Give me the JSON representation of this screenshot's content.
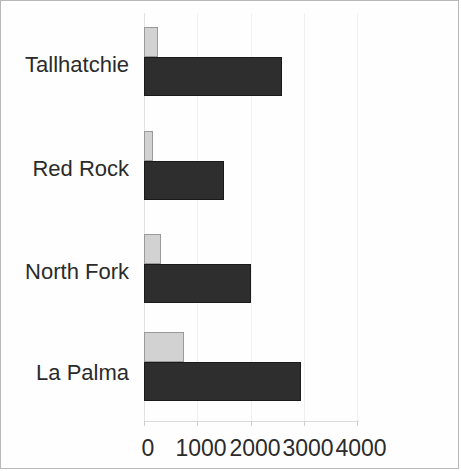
{
  "chart_data": {
    "type": "bar",
    "orientation": "horizontal",
    "title": "",
    "xlabel": "",
    "ylabel": "",
    "categories": [
      "Tallhatchie",
      "Red Rock",
      "North Fork",
      "La Palma"
    ],
    "series": [
      {
        "name": "light-series",
        "color": "#d2d2d2",
        "values": [
          270,
          170,
          320,
          750
        ]
      },
      {
        "name": "dark-series",
        "color": "#2e2e2e",
        "values": [
          2600,
          1500,
          2000,
          2950
        ]
      }
    ],
    "xticks": [
      0,
      1000,
      2000,
      3000,
      4000
    ],
    "xtick_labels": [
      "0",
      "1000",
      "2000",
      "3000",
      "4000"
    ],
    "xlim": [
      0,
      4000
    ],
    "grid": true,
    "grid_axis": "x",
    "legend": null,
    "legend_position": "none"
  },
  "axis": {
    "x_labels": [
      "0",
      "1000",
      "2000",
      "3000",
      "4000"
    ],
    "y_labels": [
      "Tallhatchie",
      "Red Rock",
      "North Fork",
      "La Palma"
    ]
  },
  "colors": {
    "light_bar": "#d2d2d2",
    "dark_bar": "#2e2e2e",
    "gridline": "#f0f0f0",
    "text": "#2b2b2b",
    "frame": "#b8b8b8",
    "background": "#ffffff"
  }
}
